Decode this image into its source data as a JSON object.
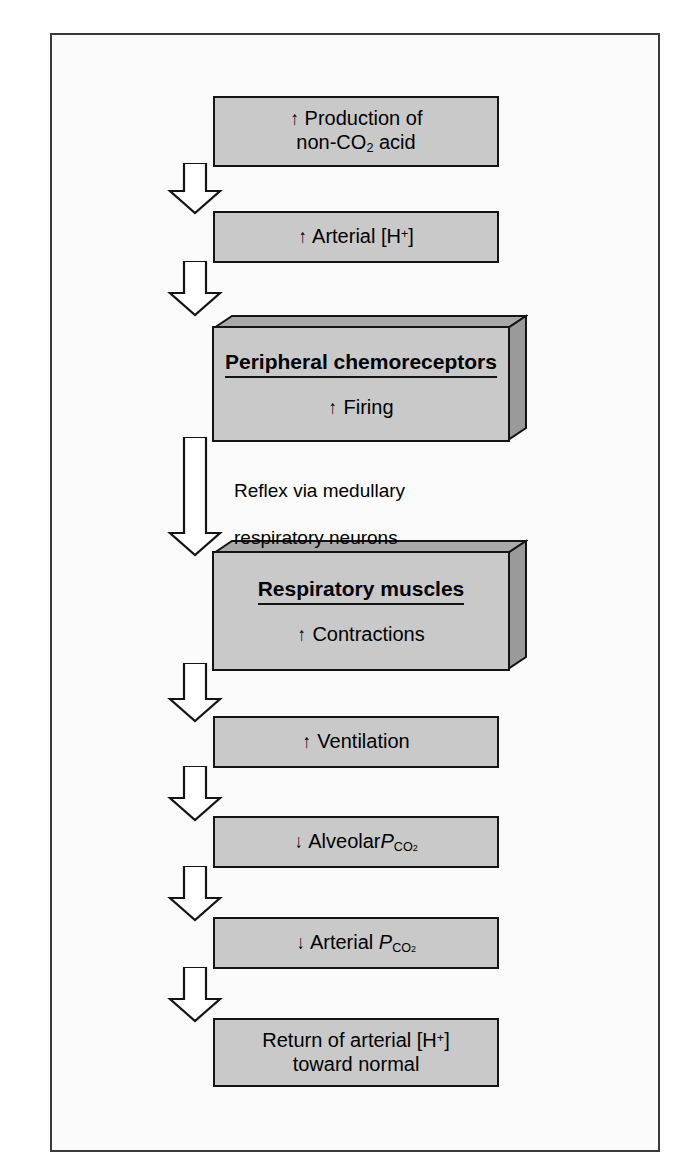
{
  "figure": {
    "kind": "flowchart",
    "orientation": "top-to-bottom",
    "colors": {
      "page_background": "#ffffff",
      "panel_background": "#fbfbfb",
      "frame_border": "#3a3a3a",
      "box_fill": "#c9c9c9",
      "box_border": "#141414",
      "block_top_face": "#a9a9a9",
      "block_side_face": "#9a9a9a",
      "arrow_fill": "#ffffff",
      "arrow_stroke": "#141414",
      "text": "#000000"
    }
  },
  "nodes": [
    {
      "id": "production",
      "style": "flat",
      "line1_arrow": "↑",
      "line1_text": " Production of",
      "line2_text": "non-CO",
      "line2_sub": "2",
      "line2_tail": " acid"
    },
    {
      "id": "arterial_h",
      "style": "flat",
      "arrow": "↑",
      "text": " Arterial [H",
      "sup": "+",
      "tail": "]"
    },
    {
      "id": "peripheral_chemoreceptors",
      "style": "block3d",
      "title": "Peripheral chemoreceptors",
      "sub_arrow": "↑",
      "sub_text": " Firing"
    },
    {
      "id": "respiratory_muscles",
      "style": "block3d",
      "title": "Respiratory muscles",
      "sub_arrow": "↑",
      "sub_text": " Contractions"
    },
    {
      "id": "ventilation",
      "style": "flat",
      "arrow": "↑",
      "text": " Ventilation"
    },
    {
      "id": "alveolar_pco2",
      "style": "flat",
      "arrow": "↓",
      "text": " Alveolar",
      "symbol": "P",
      "symbol_sub_a": "CO",
      "symbol_sub_b": "2"
    },
    {
      "id": "arterial_pco2",
      "style": "flat",
      "arrow": "↓",
      "text": " Arterial ",
      "symbol": "P",
      "symbol_sub_a": "CO",
      "symbol_sub_b": "2"
    },
    {
      "id": "return_normal",
      "style": "flat",
      "line1_text": "Return of arterial [H",
      "line1_sup": "+",
      "line1_tail": "]",
      "line2_text": "toward normal"
    }
  ],
  "annotations": {
    "reflex_note_line1": "Reflex via medullary",
    "reflex_note_line2": "respiratory neurons"
  },
  "arrows": [
    {
      "id": "arrow-1",
      "from": "production",
      "to": "arterial_h"
    },
    {
      "id": "arrow-2",
      "from": "arterial_h",
      "to": "peripheral_chemoreceptors"
    },
    {
      "id": "arrow-3",
      "from": "peripheral_chemoreceptors",
      "to": "respiratory_muscles"
    },
    {
      "id": "arrow-4",
      "from": "respiratory_muscles",
      "to": "ventilation"
    },
    {
      "id": "arrow-5",
      "from": "ventilation",
      "to": "alveolar_pco2"
    },
    {
      "id": "arrow-6",
      "from": "alveolar_pco2",
      "to": "arterial_pco2"
    },
    {
      "id": "arrow-7",
      "from": "arterial_pco2",
      "to": "return_normal"
    }
  ]
}
